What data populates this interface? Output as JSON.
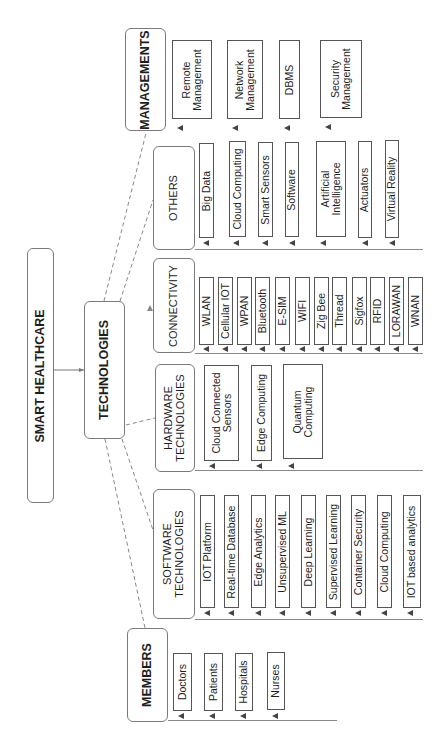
{
  "title": "SMART HEALTHCARE",
  "hub": "TECHNOLOGIES",
  "groups": {
    "managements": {
      "label": "MANAGEMENTS",
      "items": [
        "Remote\nManagement",
        "Network\nManagement",
        "DBMS",
        "Security\nManagement"
      ]
    },
    "others": {
      "label": "OTHERS",
      "items": [
        "Big Data",
        "Cloud Computing",
        "Smart Sensors",
        "Software",
        "Artificial\nIntelligence",
        "Actuators",
        "Virtual Reality"
      ]
    },
    "connectivity": {
      "label": "CONNECTIVITY",
      "items": [
        "WLAN",
        "Cellular IOT",
        "WPAN",
        "Bluetooth",
        "E-SIM",
        "WIFI",
        "Zig Bee",
        "Thread",
        "Sigfox",
        "RFID",
        "LORAWAN",
        "WNAN"
      ]
    },
    "hardware": {
      "label": "HARDWARE\nTECHNOLOGIES",
      "items": [
        "Cloud Connected\nSensors",
        "Edge Computing",
        "Quantum\nComputing"
      ]
    },
    "software": {
      "label": "SOFTWARE\nTECHNOLOGIES",
      "items": [
        "IOT Platform",
        "Real-time Database",
        "Edge Analytics",
        "Unsupervised ML",
        "Deep Learning",
        "Supervised Learning",
        "Container Security",
        "Cloud Computing",
        "IOT based analytics"
      ]
    },
    "members": {
      "label": "MEMBERS",
      "items": [
        "Doctors",
        "Patients",
        "Hospitals",
        "Nurses"
      ]
    }
  },
  "colors": {
    "border": "#6a6a6a",
    "text": "#1e1e1e",
    "line": "#888888"
  }
}
